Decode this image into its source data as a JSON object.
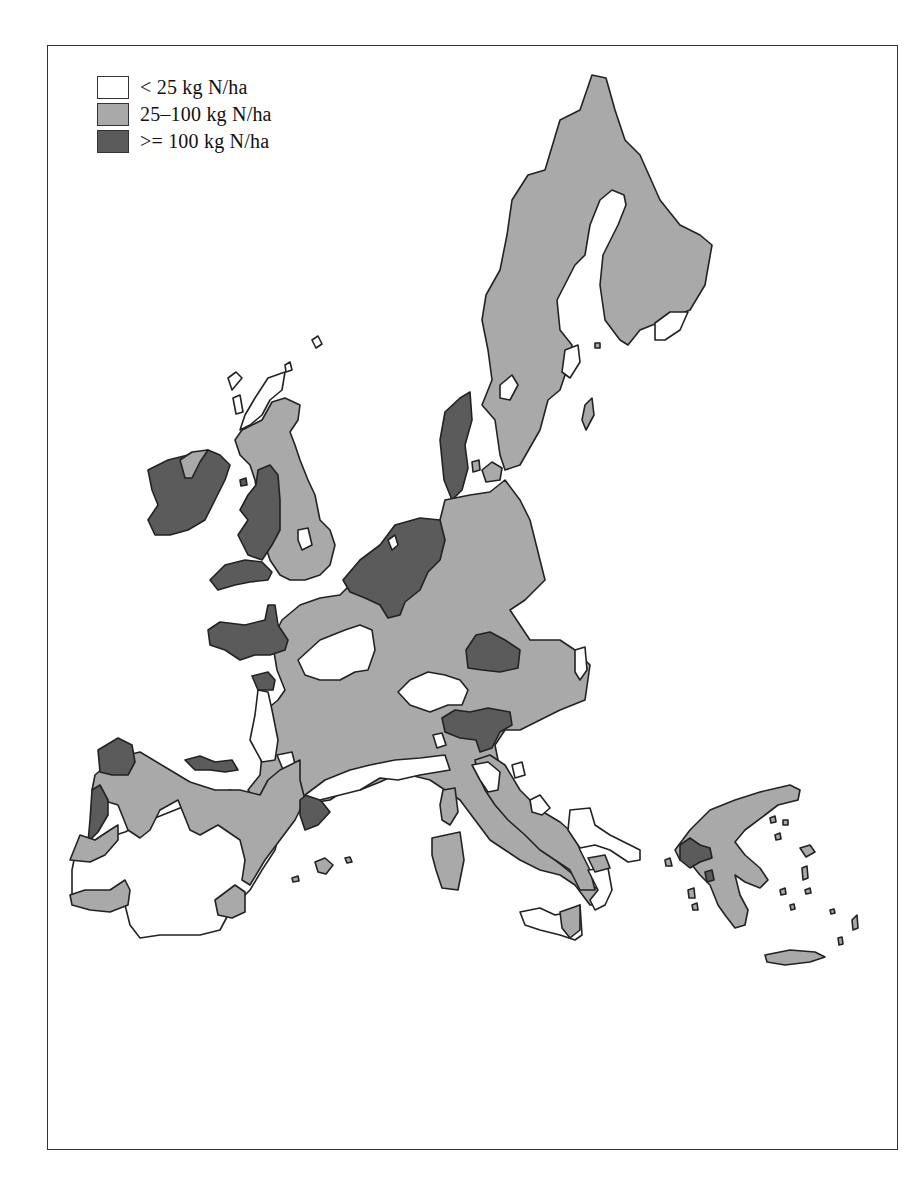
{
  "legend": {
    "items": [
      {
        "label": "< 25 kg N/ha",
        "color": "#ffffff",
        "class": "low"
      },
      {
        "label": "25–100 kg N/ha",
        "color": "#a9a9a9",
        "class": "medium"
      },
      {
        "label": ">= 100 kg N/ha",
        "color": "#5b5b5b",
        "class": "high"
      }
    ]
  },
  "colors": {
    "low": "#ffffff",
    "medium": "#a9a9a9",
    "high": "#5b5b5b",
    "outline": "#222222",
    "frame": "#333333"
  },
  "map": {
    "subject": "Nitrogen application by region, European Union",
    "unit": "kg N/ha"
  }
}
